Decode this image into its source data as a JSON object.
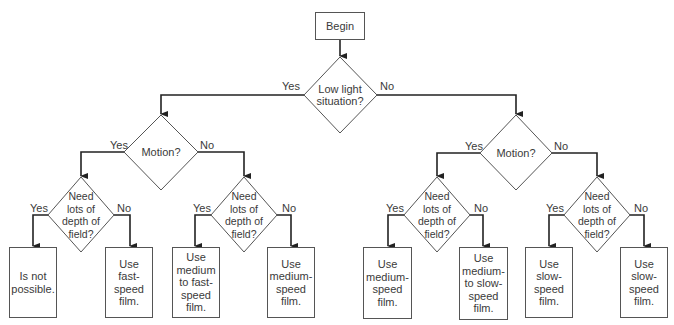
{
  "diagram": {
    "start": {
      "label": "Begin"
    },
    "root_decision": {
      "label": "Low light\nsituation?",
      "yes": "Yes",
      "no": "No"
    },
    "motion_left": {
      "label": "Motion?",
      "yes": "Yes",
      "no": "No"
    },
    "motion_right": {
      "label": "Motion?",
      "yes": "Yes",
      "no": "No"
    },
    "dof_1": {
      "label": "Need\nlots of\ndepth of\nfield?",
      "yes": "Yes",
      "no": "No"
    },
    "dof_2": {
      "label": "Need\nlots of\ndepth of\nfield?",
      "yes": "Yes",
      "no": "No"
    },
    "dof_3": {
      "label": "Need\nlots of\ndepth of\nfield?",
      "yes": "Yes",
      "no": "No"
    },
    "dof_4": {
      "label": "Need\nlots of\ndepth of\nfield?",
      "yes": "Yes",
      "no": "No"
    },
    "outcomes": [
      {
        "label": "Is not\npossible."
      },
      {
        "label": "Use\nfast-\nspeed\nfilm."
      },
      {
        "label": "Use\nmedium\nto fast-\nspeed\nfilm."
      },
      {
        "label": "Use\nmedium-\nspeed\nfilm."
      },
      {
        "label": "Use\nmedium-\nspeed\nfilm."
      },
      {
        "label": "Use\nmedium-\nto slow-\nspeed\nfilm."
      },
      {
        "label": "Use\nslow-\nspeed\nfilm."
      },
      {
        "label": "Use\nslow-\nspeed\nfilm."
      }
    ]
  }
}
